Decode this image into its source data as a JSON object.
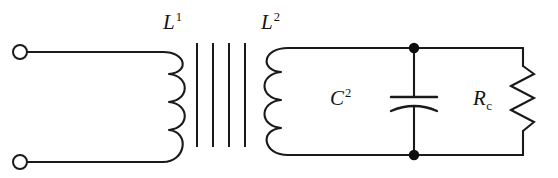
{
  "diagram": {
    "type": "schematic",
    "width": 558,
    "height": 178,
    "background_color": "#ffffff",
    "line_color": "#1a1a1a"
  },
  "labels": {
    "primary_inductor": {
      "symbol": "L",
      "superscript": "1",
      "text": "L1"
    },
    "secondary_inductor": {
      "symbol": "L",
      "superscript": "2",
      "text": "L2"
    },
    "capacitor": {
      "symbol": "C",
      "superscript": "2",
      "text": "C2"
    },
    "resistor": {
      "symbol": "R",
      "subscript": "c",
      "text": "Rc"
    }
  },
  "components": {
    "input_terminals": [
      {
        "name": "terminal-top",
        "cx": 20,
        "cy": 52,
        "r": 7
      },
      {
        "name": "terminal-bottom",
        "cx": 20,
        "cy": 162,
        "r": 7
      }
    ],
    "primary_coil": {
      "name": "L1",
      "turns": 4,
      "bulge": "right",
      "x": 180,
      "y_top": 52,
      "y_bottom": 162
    },
    "transformer_core": {
      "name": "core",
      "lines": 4,
      "x_positions": [
        197,
        213,
        229,
        245
      ],
      "y_top": 42,
      "y_bottom": 147
    },
    "secondary_coil": {
      "name": "L2",
      "turns": 4,
      "bulge": "left",
      "x": 281,
      "y_top": 48,
      "y_bottom": 155
    },
    "capacitor_branch": {
      "name": "C2",
      "x": 414,
      "plate_gap_top_y": 97,
      "plate_gap_bottom_y": 107,
      "plate_half_width": 23
    },
    "resistor_branch": {
      "name": "Rc",
      "x": 523,
      "y_top": 66,
      "y_bottom": 140,
      "zig_count": 6,
      "amplitude": 13
    },
    "junctions": [
      {
        "name": "junction-top",
        "cx": 414,
        "cy": 48,
        "r": 5
      },
      {
        "name": "junction-bottom",
        "cx": 414,
        "cy": 155,
        "r": 5
      }
    ],
    "rails": {
      "top_y": 48,
      "bottom_y": 155,
      "right_x": 523,
      "left_lead_top_y": 52,
      "left_lead_bottom_y": 162
    }
  }
}
